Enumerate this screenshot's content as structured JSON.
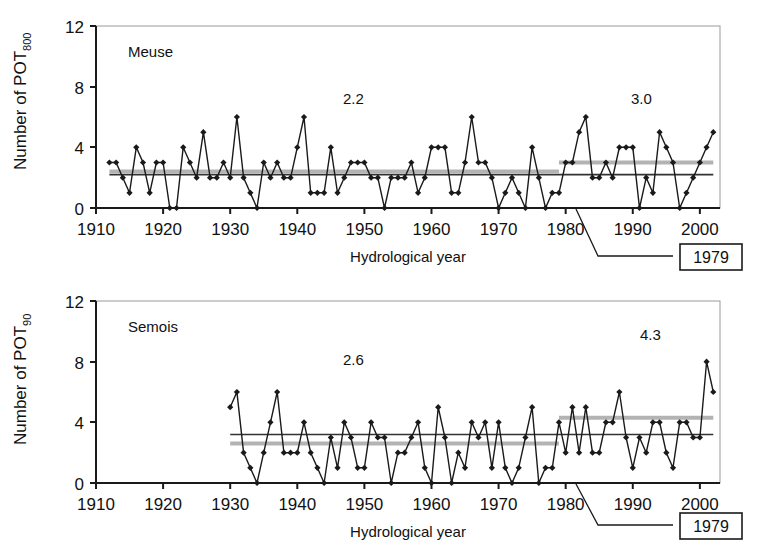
{
  "figure": {
    "background": "#ffffff",
    "line_color": "#1a1a1a",
    "marker_color": "#1a1a1a",
    "mean_before_color": "#333333",
    "mean_after_color": "#b3b3b3",
    "axis_color": "#1a1a1a"
  },
  "annotation_box": {
    "label": "1979",
    "leader_note": "leader line pointing from 1979 on the x-axis to the boxed year label"
  },
  "axis_title": "Hydrological year",
  "panels": [
    {
      "id": "meuse",
      "series_label": "Meuse",
      "ylabel_prefix": "Number of POT",
      "ylabel_suffix": "800",
      "mean_before_label": "2.2",
      "mean_after_label": "3.0"
    },
    {
      "id": "semois",
      "series_label": "Semois",
      "ylabel_prefix": "Number of POT",
      "ylabel_suffix": "90",
      "mean_before_label": "2.6",
      "mean_after_label": "4.3"
    }
  ],
  "chart_data": [
    {
      "type": "line",
      "id": "meuse",
      "title": "Meuse",
      "xlabel": "Hydrological year",
      "ylabel": "Number of POT800",
      "xlim": [
        1910,
        2003
      ],
      "ylim": [
        0,
        12
      ],
      "xticks": [
        1910,
        1920,
        1930,
        1940,
        1950,
        1960,
        1970,
        1980,
        1990,
        2000
      ],
      "yticks": [
        0,
        4,
        8,
        12
      ],
      "grid": false,
      "legend": "none",
      "breakpoint_year": 1979,
      "annotations": [
        {
          "text": "2.2",
          "x": 1952,
          "y": 9.0,
          "meaning": "mean number of POT800 before 1979"
        },
        {
          "text": "3.0",
          "x": 1988,
          "y": 9.0,
          "meaning": "mean number of POT800 from 1979 onwards"
        },
        {
          "text": "Meuse",
          "x": 1922,
          "y": 10.6,
          "meaning": "river name"
        },
        {
          "text": "1979",
          "x": 1992,
          "y": -3.2,
          "meaning": "boxed breakpoint year label"
        }
      ],
      "mean_lines": [
        {
          "name": "mean before 1979",
          "value": 2.2,
          "x_start": 1912,
          "x_end": 2002,
          "color": "#333333",
          "note": "dark thin line spanning full record"
        },
        {
          "name": "mean segment pre-1979",
          "value": 2.4,
          "x_start": 1912,
          "x_end": 1979,
          "color": "#b3b3b3",
          "note": "grey thick line"
        },
        {
          "name": "mean segment post-1979",
          "value": 3.0,
          "x_start": 1979,
          "x_end": 2002,
          "color": "#b3b3b3",
          "note": "grey thick line, raised"
        }
      ],
      "x": [
        1912,
        1913,
        1914,
        1915,
        1916,
        1917,
        1918,
        1919,
        1920,
        1921,
        1922,
        1923,
        1924,
        1925,
        1926,
        1927,
        1928,
        1929,
        1930,
        1931,
        1932,
        1933,
        1934,
        1935,
        1936,
        1937,
        1938,
        1939,
        1940,
        1941,
        1942,
        1943,
        1944,
        1945,
        1946,
        1947,
        1948,
        1949,
        1950,
        1951,
        1952,
        1953,
        1954,
        1955,
        1956,
        1957,
        1958,
        1959,
        1960,
        1961,
        1962,
        1963,
        1964,
        1965,
        1966,
        1967,
        1968,
        1969,
        1970,
        1971,
        1972,
        1973,
        1974,
        1975,
        1976,
        1977,
        1978,
        1979,
        1980,
        1981,
        1982,
        1983,
        1984,
        1985,
        1986,
        1987,
        1988,
        1989,
        1990,
        1991,
        1992,
        1993,
        1994,
        1995,
        1996,
        1997,
        1998,
        1999,
        2000,
        2001,
        2002
      ],
      "values": [
        3,
        3,
        2,
        1,
        4,
        3,
        1,
        3,
        3,
        0,
        0,
        4,
        3,
        2,
        5,
        2,
        2,
        3,
        2,
        6,
        2,
        1,
        0,
        3,
        2,
        3,
        2,
        2,
        4,
        6,
        1,
        1,
        1,
        4,
        1,
        2,
        3,
        3,
        3,
        2,
        2,
        0,
        2,
        2,
        2,
        3,
        1,
        2,
        4,
        4,
        4,
        1,
        1,
        3,
        6,
        3,
        3,
        2,
        0,
        1,
        2,
        1,
        0,
        4,
        2,
        0,
        1,
        1,
        3,
        3,
        5,
        6,
        2,
        2,
        3,
        2,
        4,
        4,
        4,
        0,
        2,
        1,
        5,
        4,
        3,
        0,
        1,
        2,
        3,
        4,
        5
      ]
    },
    {
      "type": "line",
      "id": "semois",
      "title": "Semois",
      "xlabel": "Hydrological year",
      "ylabel": "Number of POT90",
      "xlim": [
        1910,
        2003
      ],
      "ylim": [
        0,
        12
      ],
      "xticks": [
        1910,
        1920,
        1930,
        1940,
        1950,
        1960,
        1970,
        1980,
        1990,
        2000
      ],
      "yticks": [
        0,
        4,
        8,
        12
      ],
      "grid": false,
      "legend": "none",
      "breakpoint_year": 1979,
      "annotations": [
        {
          "text": "2.6",
          "x": 1952,
          "y": 7.0,
          "meaning": "mean number of POT90 before 1979"
        },
        {
          "text": "4.3",
          "x": 1989,
          "y": 8.6,
          "meaning": "mean number of POT90 from 1979 onwards"
        },
        {
          "text": "Semois",
          "x": 1922,
          "y": 10.6,
          "meaning": "river name"
        },
        {
          "text": "1979",
          "x": 1992,
          "y": -3.2,
          "meaning": "boxed breakpoint year label"
        }
      ],
      "mean_lines": [
        {
          "name": "mean overall",
          "value": 3.2,
          "x_start": 1930,
          "x_end": 2002,
          "color": "#333333",
          "note": "dark thin line spanning record"
        },
        {
          "name": "mean segment pre-1979",
          "value": 2.6,
          "x_start": 1930,
          "x_end": 1979,
          "color": "#b3b3b3",
          "note": "grey thick line"
        },
        {
          "name": "mean segment post-1979",
          "value": 4.3,
          "x_start": 1979,
          "x_end": 2002,
          "color": "#b3b3b3",
          "note": "grey thick line, raised"
        }
      ],
      "x": [
        1930,
        1931,
        1932,
        1933,
        1934,
        1935,
        1936,
        1937,
        1938,
        1939,
        1940,
        1941,
        1942,
        1943,
        1944,
        1945,
        1946,
        1947,
        1948,
        1949,
        1950,
        1951,
        1952,
        1953,
        1954,
        1955,
        1956,
        1957,
        1958,
        1959,
        1960,
        1961,
        1962,
        1963,
        1964,
        1965,
        1966,
        1967,
        1968,
        1969,
        1970,
        1971,
        1972,
        1973,
        1974,
        1975,
        1976,
        1977,
        1978,
        1979,
        1980,
        1981,
        1982,
        1983,
        1984,
        1985,
        1986,
        1987,
        1988,
        1989,
        1990,
        1991,
        1992,
        1993,
        1994,
        1995,
        1996,
        1997,
        1998,
        1999,
        2000,
        2001,
        2002
      ],
      "values": [
        5,
        6,
        2,
        1,
        0,
        2,
        4,
        6,
        2,
        2,
        2,
        4,
        2,
        1,
        0,
        3,
        1,
        4,
        3,
        1,
        1,
        4,
        3,
        3,
        0,
        2,
        2,
        3,
        4,
        1,
        0,
        5,
        3,
        0,
        2,
        1,
        4,
        3,
        4,
        1,
        4,
        1,
        0,
        1,
        3,
        5,
        0,
        1,
        1,
        4,
        2,
        5,
        2,
        5,
        2,
        2,
        4,
        4,
        6,
        3,
        1,
        3,
        2,
        4,
        4,
        2,
        1,
        4,
        4,
        3,
        3,
        8,
        6
      ]
    }
  ]
}
